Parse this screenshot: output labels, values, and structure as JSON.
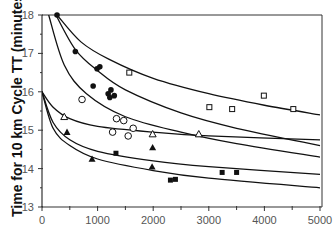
{
  "chart_data": {
    "type": "scatter",
    "title": "",
    "xlabel": "",
    "ylabel": "Time for 10  km Cycle TT (minutes)",
    "xlim": [
      0,
      5000
    ],
    "ylim": [
      13,
      18
    ],
    "xticks": [
      "0",
      "1000",
      "2000",
      "3000",
      "4000",
      "5000"
    ],
    "yticks": [
      "13",
      "14",
      "15",
      "16",
      "17",
      "18"
    ],
    "grid": false,
    "legend": null,
    "series": [
      {
        "name": "filled-circles",
        "marker": "circle-filled",
        "x": [
          270,
          600,
          990,
          1040,
          920,
          1240,
          1190,
          1220,
          1300
        ],
        "y": [
          18.0,
          17.05,
          16.6,
          16.65,
          16.15,
          16.05,
          15.95,
          15.85,
          15.9
        ]
      },
      {
        "name": "open-circles",
        "marker": "circle-open",
        "x": [
          720,
          1340,
          1470,
          1640,
          1270,
          1550
        ],
        "y": [
          15.8,
          15.3,
          15.25,
          15.05,
          14.95,
          14.85
        ]
      },
      {
        "name": "open-squares",
        "marker": "square-open",
        "x": [
          1570,
          3010,
          3420,
          3990,
          4520
        ],
        "y": [
          16.5,
          15.6,
          15.55,
          15.9,
          15.55
        ]
      },
      {
        "name": "open-triangles",
        "marker": "triangle-open",
        "x": [
          400,
          1990,
          2820
        ],
        "y": [
          15.35,
          14.9,
          14.9
        ]
      },
      {
        "name": "filled-triangles",
        "marker": "triangle-filled",
        "x": [
          450,
          900,
          1990,
          1980
        ],
        "y": [
          14.95,
          14.25,
          14.55,
          14.05
        ]
      },
      {
        "name": "filled-squares",
        "marker": "square-filled",
        "x": [
          1330,
          2310,
          2400,
          3240,
          3500
        ],
        "y": [
          14.4,
          13.7,
          13.72,
          13.9,
          13.9
        ]
      }
    ],
    "curves": [
      {
        "name": "curve-a",
        "points": [
          [
            270,
            18.0
          ],
          [
            700,
            17.3
          ],
          [
            1200,
            16.85
          ],
          [
            2000,
            16.35
          ],
          [
            3000,
            15.95
          ],
          [
            4000,
            15.65
          ],
          [
            5000,
            15.4
          ]
        ]
      },
      {
        "name": "curve-b",
        "points": [
          [
            250,
            18.0
          ],
          [
            600,
            17.1
          ],
          [
            1000,
            16.55
          ],
          [
            1500,
            16.05
          ],
          [
            2500,
            15.45
          ],
          [
            3500,
            15.05
          ],
          [
            5000,
            14.6
          ]
        ]
      },
      {
        "name": "curve-c",
        "points": [
          [
            120,
            18.0
          ],
          [
            400,
            16.7
          ],
          [
            800,
            15.95
          ],
          [
            1500,
            15.35
          ],
          [
            2500,
            14.95
          ],
          [
            3500,
            14.65
          ],
          [
            5000,
            14.3
          ]
        ]
      },
      {
        "name": "curve-d",
        "points": [
          [
            0,
            16.0
          ],
          [
            200,
            15.6
          ],
          [
            500,
            15.3
          ],
          [
            1000,
            15.1
          ],
          [
            2000,
            14.95
          ],
          [
            3000,
            14.85
          ],
          [
            5000,
            14.75
          ]
        ]
      },
      {
        "name": "curve-e",
        "points": [
          [
            0,
            16.0
          ],
          [
            200,
            15.2
          ],
          [
            500,
            14.75
          ],
          [
            1000,
            14.45
          ],
          [
            2000,
            14.2
          ],
          [
            3000,
            14.05
          ],
          [
            5000,
            13.85
          ]
        ]
      },
      {
        "name": "curve-f",
        "points": [
          [
            0,
            16.0
          ],
          [
            200,
            15.05
          ],
          [
            500,
            14.6
          ],
          [
            1000,
            14.25
          ],
          [
            2000,
            13.95
          ],
          [
            3000,
            13.75
          ],
          [
            5000,
            13.5
          ]
        ]
      }
    ],
    "colors": {
      "line": "#111111",
      "axis": "#333333",
      "tick_text": "#555555"
    }
  }
}
